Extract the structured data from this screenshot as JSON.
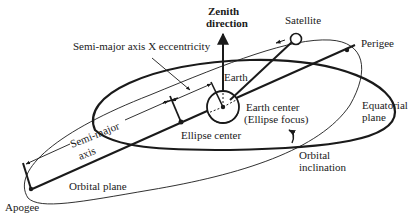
{
  "diagram": {
    "ink_color": "#1a1a1a",
    "background": "#ffffff",
    "labels": {
      "zenith_line1": "Zenith",
      "zenith_line2": "direction",
      "satellite": "Satellite",
      "perigee": "Perigee",
      "semi_major_ecc": "Semi-major axis X eccentricity",
      "earth": "Earth",
      "earth_center_line1": "Earth center",
      "earth_center_line2": "(Ellipse focus)",
      "equatorial_line1": "Equatorial",
      "equatorial_line2": "plane",
      "ellipse_center": "Ellipse center",
      "semi_major_line1": "Semi-major",
      "semi_major_line2": "axis",
      "orbital_plane": "Orbital plane",
      "orbital_inclination_line1": "Orbital",
      "orbital_inclination_line2": "inclination",
      "apogee": "Apogee"
    },
    "nodes": [
      {
        "id": "earth",
        "label": "Earth",
        "type": "circle"
      },
      {
        "id": "satellite",
        "label": "Satellite",
        "type": "small-circle"
      },
      {
        "id": "perigee",
        "label": "Perigee",
        "type": "point"
      },
      {
        "id": "apogee",
        "label": "Apogee",
        "type": "point"
      },
      {
        "id": "ellipse-center",
        "label": "Ellipse center",
        "type": "point"
      },
      {
        "id": "earth-center",
        "label": "Earth center (Ellipse focus)",
        "type": "point"
      }
    ],
    "edges": [
      {
        "from": "apogee",
        "to": "perigee",
        "label": "line of apsides"
      },
      {
        "from": "earth-center",
        "to": "satellite",
        "label": "radius vector"
      },
      {
        "from": "earth-center",
        "to": "zenith",
        "label": "Zenith direction"
      }
    ]
  }
}
